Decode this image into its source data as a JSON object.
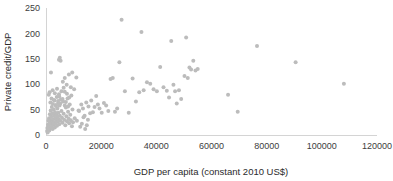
{
  "chart_data": {
    "type": "scatter",
    "title": "",
    "xlabel": "GDP per capita (constant 2010 US$)",
    "ylabel": "Private credit/GDP",
    "xlim": [
      0,
      120000
    ],
    "ylim": [
      0,
      250
    ],
    "xticks": [
      "0",
      "20000",
      "40000",
      "60000",
      "80000",
      "100000",
      "120000"
    ],
    "xtick_values": [
      0,
      20000,
      40000,
      60000,
      80000,
      100000,
      120000
    ],
    "yticks": [
      "0",
      "50",
      "100",
      "150",
      "200",
      "250"
    ],
    "ytick_values": [
      0,
      50,
      100,
      150,
      200,
      250
    ],
    "grid": false,
    "legend": null,
    "marker_color": "#bcbcbc",
    "marker_size": 4,
    "series": [
      {
        "name": "Countries",
        "points": [
          [
            400,
            8
          ],
          [
            500,
            14
          ],
          [
            600,
            5
          ],
          [
            700,
            20
          ],
          [
            800,
            11
          ],
          [
            900,
            28
          ],
          [
            1000,
            17
          ],
          [
            1100,
            33
          ],
          [
            1200,
            9
          ],
          [
            1300,
            24
          ],
          [
            1400,
            41
          ],
          [
            1500,
            13
          ],
          [
            1600,
            30
          ],
          [
            1700,
            48
          ],
          [
            1800,
            22
          ],
          [
            1900,
            36
          ],
          [
            2000,
            16
          ],
          [
            2100,
            55
          ],
          [
            2200,
            27
          ],
          [
            2300,
            43
          ],
          [
            2400,
            12
          ],
          [
            2500,
            61
          ],
          [
            2600,
            31
          ],
          [
            2700,
            20
          ],
          [
            2800,
            50
          ],
          [
            2900,
            38
          ],
          [
            3000,
            25
          ],
          [
            3100,
            68
          ],
          [
            3200,
            15
          ],
          [
            3300,
            45
          ],
          [
            3400,
            33
          ],
          [
            3500,
            22
          ],
          [
            3600,
            57
          ],
          [
            3700,
            40
          ],
          [
            3800,
            29
          ],
          [
            3900,
            75
          ],
          [
            4000,
            18
          ],
          [
            4100,
            52
          ],
          [
            4200,
            36
          ],
          [
            4300,
            26
          ],
          [
            4400,
            63
          ],
          [
            4500,
            44
          ],
          [
            4600,
            31
          ],
          [
            4700,
            80
          ],
          [
            4800,
            21
          ],
          [
            4900,
            58
          ],
          [
            5000,
            38
          ],
          [
            5200,
            28
          ],
          [
            5400,
            70
          ],
          [
            5600,
            47
          ],
          [
            5800,
            34
          ],
          [
            6000,
            24
          ],
          [
            6200,
            66
          ],
          [
            6400,
            42
          ],
          [
            6600,
            30
          ],
          [
            6800,
            85
          ],
          [
            7000,
            19
          ],
          [
            7200,
            54
          ],
          [
            7400,
            37
          ],
          [
            7600,
            27
          ],
          [
            7800,
            72
          ],
          [
            8000,
            46
          ],
          [
            8200,
            32
          ],
          [
            8400,
            23
          ],
          [
            8600,
            60
          ],
          [
            8800,
            40
          ],
          [
            9000,
            29
          ],
          [
            9200,
            78
          ],
          [
            9400,
            17
          ],
          [
            9600,
            50
          ],
          [
            1000,
            79
          ],
          [
            1300,
            84
          ],
          [
            1600,
            64
          ],
          [
            2000,
            72
          ],
          [
            2400,
            88
          ],
          [
            2800,
            69
          ],
          [
            3200,
            82
          ],
          [
            3600,
            59
          ],
          [
            4000,
            91
          ],
          [
            4400,
            67
          ],
          [
            4800,
            76
          ],
          [
            5200,
            62
          ],
          [
            5600,
            86
          ],
          [
            6000,
            71
          ],
          [
            6400,
            93
          ],
          [
            6800,
            58
          ],
          [
            7200,
            65
          ],
          [
            7600,
            81
          ],
          [
            8000,
            56
          ],
          [
            8400,
            74
          ],
          [
            1800,
            123
          ],
          [
            4700,
            148
          ],
          [
            5000,
            152
          ],
          [
            5300,
            146
          ],
          [
            6100,
            105
          ],
          [
            6800,
            112
          ],
          [
            7500,
            99
          ],
          [
            8300,
            119
          ],
          [
            9000,
            94
          ],
          [
            9500,
            123
          ],
          [
            10200,
            90
          ],
          [
            11000,
            113
          ],
          [
            11800,
            48
          ],
          [
            12400,
            16
          ],
          [
            13000,
            22
          ],
          [
            13600,
            35
          ],
          [
            14200,
            12
          ],
          [
            14800,
            19
          ],
          [
            15400,
            56
          ],
          [
            16000,
            43
          ],
          [
            9800,
            25
          ],
          [
            10400,
            33
          ],
          [
            11200,
            28
          ],
          [
            12000,
            47
          ],
          [
            12800,
            60
          ],
          [
            13400,
            52
          ],
          [
            14000,
            38
          ],
          [
            14600,
            64
          ],
          [
            15200,
            30
          ],
          [
            16400,
            68
          ],
          [
            17000,
            45
          ],
          [
            17600,
            55
          ],
          [
            18200,
            77
          ],
          [
            18800,
            60
          ],
          [
            19400,
            52
          ],
          [
            20200,
            44
          ],
          [
            21000,
            63
          ],
          [
            21800,
            58
          ],
          [
            22600,
            47
          ],
          [
            23400,
            110
          ],
          [
            24200,
            112
          ],
          [
            25000,
            46
          ],
          [
            25800,
            52
          ],
          [
            26600,
            143
          ],
          [
            27400,
            227
          ],
          [
            28600,
            86
          ],
          [
            30000,
            44
          ],
          [
            31400,
            111
          ],
          [
            32600,
            66
          ],
          [
            33800,
            84
          ],
          [
            34600,
            203
          ],
          [
            35400,
            88
          ],
          [
            36600,
            104
          ],
          [
            37800,
            101
          ],
          [
            39000,
            90
          ],
          [
            40200,
            86
          ],
          [
            41400,
            134
          ],
          [
            42600,
            94
          ],
          [
            43800,
            87
          ],
          [
            44600,
            74
          ],
          [
            45400,
            185
          ],
          [
            46200,
            99
          ],
          [
            46800,
            86
          ],
          [
            47400,
            62
          ],
          [
            48200,
            88
          ],
          [
            49000,
            71
          ],
          [
            50200,
            116
          ],
          [
            50800,
            192
          ],
          [
            51400,
            112
          ],
          [
            52000,
            133
          ],
          [
            52600,
            129
          ],
          [
            53400,
            146
          ],
          [
            54200,
            127
          ],
          [
            55000,
            130
          ],
          [
            66000,
            79
          ],
          [
            69500,
            46
          ],
          [
            76500,
            175
          ],
          [
            90500,
            143
          ],
          [
            108000,
            101
          ]
        ]
      }
    ]
  },
  "axes": {
    "x_axis_name": "x-axis",
    "y_axis_name": "y-axis"
  }
}
